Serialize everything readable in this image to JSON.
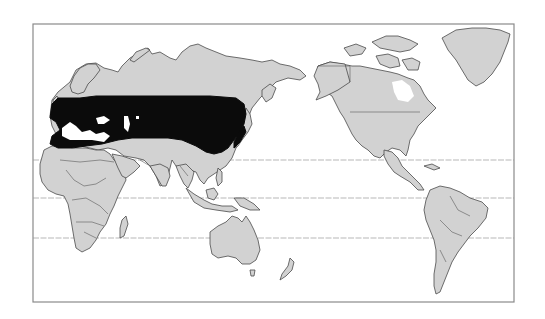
{
  "map": {
    "type": "world distribution map",
    "projection_center": "Pacific-centered",
    "frame": {
      "x": 33,
      "y": 24,
      "width": 481,
      "height": 278
    },
    "latitude_lines_y": [
      160,
      198,
      238
    ],
    "colors": {
      "land": "#d2d2d2",
      "outline": "#4a4a4a",
      "range": "#0b0b0b",
      "ocean": "#ffffff",
      "frame": "#8a8a8a"
    },
    "regions": {
      "shaded_range": "Southern Europe, Mediterranean, North Africa coast, Central Asia to Japan",
      "continents": [
        "Europe",
        "Asia",
        "Africa",
        "Australia",
        "North America",
        "South America",
        "Greenland"
      ]
    }
  }
}
